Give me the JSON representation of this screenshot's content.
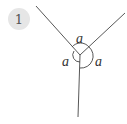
{
  "badge": {
    "number": "1"
  },
  "diagram": {
    "angle_labels": [
      "a",
      "a",
      "a"
    ],
    "colors": {
      "line": "#444444",
      "badge_bg": "#e6e6e6"
    }
  }
}
